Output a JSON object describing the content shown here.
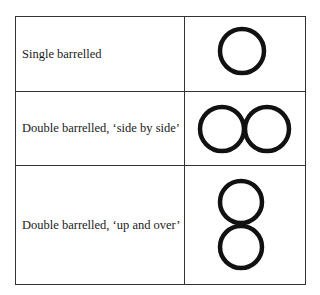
{
  "table": {
    "rows": [
      {
        "label": "Single barrelled",
        "symbol": "single-circle-icon"
      },
      {
        "label": "Double barrelled, ‘side by side’",
        "symbol": "two-circles-horizontal-icon"
      },
      {
        "label": "Double barrelled, ‘up and over’",
        "symbol": "two-circles-vertical-icon"
      }
    ]
  },
  "colors": {
    "stroke": "#111111",
    "border": "#333333"
  }
}
